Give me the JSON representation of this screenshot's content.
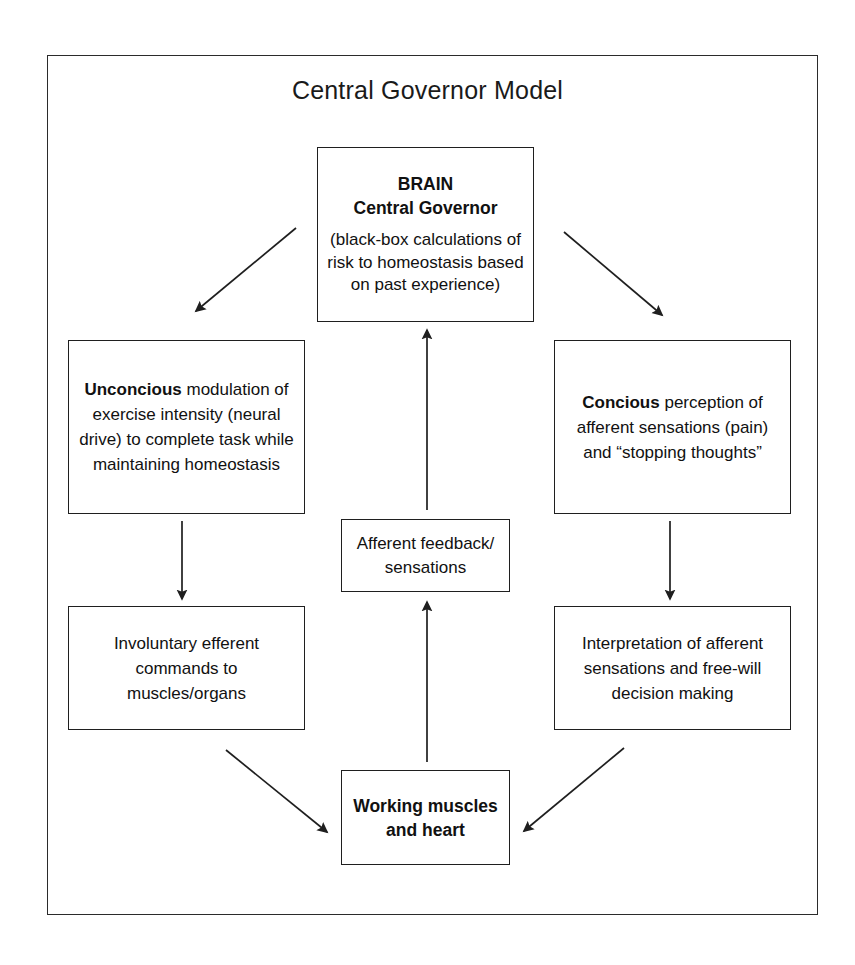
{
  "title": "Central Governor Model",
  "nodes": {
    "brain": {
      "heading_line1": "BRAIN",
      "heading_line2": "Central Governor",
      "body": "(black-box calculations of risk to homeostasis based on past experience)"
    },
    "unconscious": {
      "lead": "Unconcious",
      "rest": " modulation of exercise intensity (neural drive) to complete task while maintaining homeostasis"
    },
    "conscious": {
      "lead": "Concious",
      "rest": " perception of afferent sensations (pain) and “stopping thoughts”"
    },
    "afferent": {
      "text": "Afferent feedback/ sensations"
    },
    "involuntary": {
      "text": "Involuntary efferent commands to muscles/organs"
    },
    "interpretation": {
      "text": "Interpretation of afferent sensations and free-will decision making"
    },
    "muscles": {
      "line1": "Working muscles",
      "line2": "and heart"
    }
  },
  "edges": [
    {
      "name": "brain-to-unconscious",
      "from": "brain",
      "to": "unconscious",
      "direction": "down-left"
    },
    {
      "name": "brain-to-conscious",
      "from": "brain",
      "to": "conscious",
      "direction": "down-right"
    },
    {
      "name": "unconscious-to-involuntary",
      "from": "unconscious",
      "to": "involuntary",
      "direction": "down"
    },
    {
      "name": "conscious-to-interpretation",
      "from": "conscious",
      "to": "interpretation",
      "direction": "down"
    },
    {
      "name": "involuntary-to-muscles",
      "from": "involuntary",
      "to": "muscles",
      "direction": "down-right"
    },
    {
      "name": "interpretation-to-muscles",
      "from": "interpretation",
      "to": "muscles",
      "direction": "down-left"
    },
    {
      "name": "muscles-to-afferent",
      "from": "muscles",
      "to": "afferent",
      "direction": "up"
    },
    {
      "name": "afferent-to-brain",
      "from": "afferent",
      "to": "brain",
      "direction": "up"
    }
  ],
  "colors": {
    "stroke": "#1f1f1f",
    "frame": "#2b2b2b",
    "text": "#111111",
    "background": "#ffffff"
  }
}
